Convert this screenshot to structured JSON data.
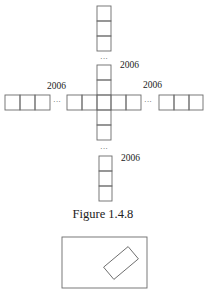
{
  "figure": {
    "caption": "Figure 1.4.8",
    "labels": {
      "top_right": "2006",
      "left": "2006",
      "right": "2006",
      "bottom_right": "2006"
    },
    "ellipsis": "···",
    "arms": {
      "top": {
        "cells": 3
      },
      "left": {
        "cells": 3
      },
      "right": {
        "cells": 3
      },
      "bottom": {
        "cells": 3
      }
    },
    "center_cross": {
      "vertical_cells": 5,
      "horizontal_cells": 5
    }
  },
  "second_figure": {
    "description": "rectangle containing a smaller rotated rectangle"
  }
}
